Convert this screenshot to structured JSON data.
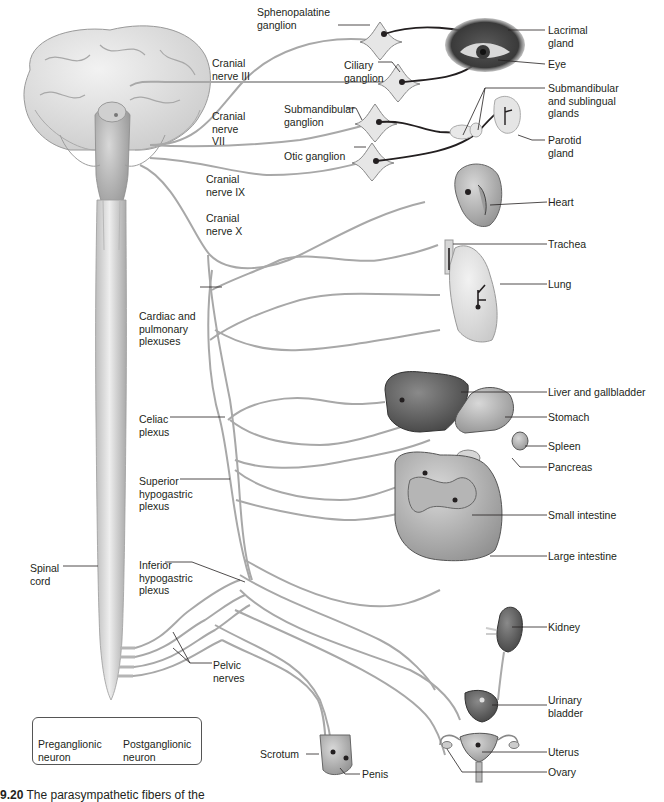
{
  "figure": {
    "caption_number": "9.20",
    "caption_text": "The parasympathetic fibers of the",
    "colors": {
      "preganglionic": "#a8a8a8",
      "postganglionic": "#231f20",
      "ganglion_fill": "#e6e6e6",
      "label_text": "#231f20",
      "leader_line": "#231f20"
    }
  },
  "labels": {
    "cranial_nerve_iii": "Cranial\nnerve III",
    "cranial_nerve_vii": "Cranial\nnerve\nVII",
    "cranial_nerve_ix": "Cranial\nnerve IX",
    "cranial_nerve_x": "Cranial\nnerve X",
    "sphenopalatine_ganglion": "Sphenopalatine\nganglion",
    "ciliary_ganglion": "Ciliary\nganglion",
    "submandibular_ganglion": "Submandibular\nganglion",
    "otic_ganglion": "Otic ganglion",
    "cardiac_pulmonary_plexuses": "Cardiac and\npulmonary\nplexuses",
    "celiac_plexus": "Celiac\nplexus",
    "superior_hypogastric_plexus": "Superior\nhypogastric\nplexus",
    "inferior_hypogastric_plexus": "Inferior\nhypogastric\nplexus",
    "spinal_cord": "Spinal\ncord",
    "pelvic_nerves": "Pelvic\nnerves",
    "lacrimal_gland": "Lacrimal\ngland",
    "eye": "Eye",
    "submandibular_sublingual_glands": "Submandibular\nand sublingual\nglands",
    "parotid_gland": "Parotid\ngland",
    "heart": "Heart",
    "trachea": "Trachea",
    "lung": "Lung",
    "liver_gallbladder": "Liver and gallbladder",
    "stomach": "Stomach",
    "spleen": "Spleen",
    "pancreas": "Pancreas",
    "small_intestine": "Small intestine",
    "large_intestine": "Large intestine",
    "kidney": "Kidney",
    "urinary_bladder": "Urinary\nbladder",
    "uterus": "Uterus",
    "ovary": "Ovary",
    "scrotum": "Scrotum",
    "penis": "Penis"
  },
  "legend": {
    "preganglionic": "Preganglionic\nneuron",
    "postganglionic": "Postganglionic\nneuron"
  }
}
